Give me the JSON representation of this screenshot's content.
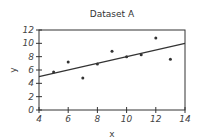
{
  "chart_data": {
    "type": "scatter",
    "title": "Dataset A",
    "xlabel": "x",
    "ylabel": "y",
    "xlim": [
      4,
      14
    ],
    "ylim": [
      0,
      12
    ],
    "xticks": [
      4,
      6,
      8,
      10,
      12,
      14
    ],
    "yticks": [
      0,
      2,
      4,
      6,
      8,
      10,
      12
    ],
    "grid": false,
    "legend": null,
    "series": [
      {
        "name": "Dataset A",
        "x": [
          5,
          6,
          7,
          8,
          9,
          10,
          11,
          12,
          13
        ],
        "y": [
          5.7,
          7.2,
          4.8,
          6.9,
          8.8,
          8.0,
          8.3,
          10.8,
          7.6
        ]
      }
    ],
    "fit_line": {
      "x": [
        4,
        14
      ],
      "y": [
        5.0,
        10.0
      ],
      "equation": "y = 3 + 0.5x"
    },
    "colors": {
      "axis": "#333333",
      "points": "#333333",
      "line": "#333333"
    }
  }
}
